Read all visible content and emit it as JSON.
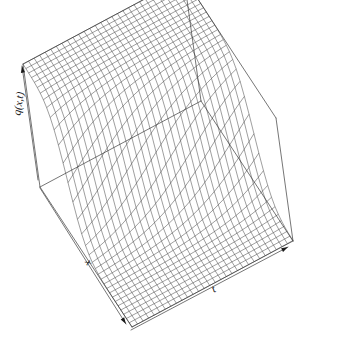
{
  "figure": {
    "kind": "perspective-surface-plot",
    "background_color": "#ffffff",
    "line_color": "#2b2b2b",
    "box_color": "#555555",
    "width": 348,
    "height": 340
  },
  "axes": {
    "x_label": "x",
    "t_label": "t",
    "q_label": "q(x,t)",
    "x_label_pos": {
      "x": 86,
      "y": 264
    },
    "t_label_pos": {
      "x": 215,
      "y": 292
    },
    "q_label_pos": {
      "x": 22,
      "y": 104
    }
  },
  "chart_data": {
    "type": "surface",
    "title": "",
    "xlabel": "x",
    "ylabel": "t",
    "zlabel": "q(x,t)",
    "grid": true,
    "legend": "none",
    "projection": {
      "theta": 35,
      "phi": 22,
      "expand": 0.9
    },
    "xlim": [
      -10,
      10
    ],
    "ylim": [
      0,
      10
    ],
    "zlim": [
      0,
      1
    ],
    "nx": 34,
    "nt": 30,
    "surface_formula": "q(x,t) = 0.5*(1 - tanh((x - 0.55*t + 2.2)/2.4))",
    "x_ticks": [],
    "t_ticks": [],
    "q_ticks": []
  },
  "arrows": [
    {
      "name": "q-axis-arrow",
      "from": {
        "x": 38,
        "y": 180
      },
      "to": {
        "x": 22,
        "y": 66
      }
    },
    {
      "name": "x-axis-arrow",
      "from": {
        "x": 40,
        "y": 188
      },
      "to": {
        "x": 126,
        "y": 324
      }
    },
    {
      "name": "t-axis-arrow",
      "from": {
        "x": 131,
        "y": 330
      },
      "to": {
        "x": 288,
        "y": 247
      }
    }
  ]
}
